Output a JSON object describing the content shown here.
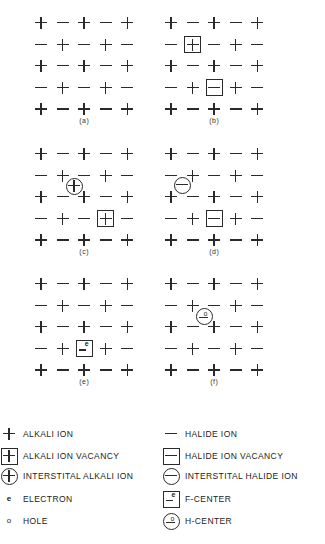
{
  "figure": {
    "panels": [
      {
        "id": "a",
        "label": "(a)",
        "origin": [
          41,
          23
        ],
        "defects": []
      },
      {
        "id": "b",
        "label": "(b)",
        "origin": [
          171,
          23
        ],
        "defects": [
          {
            "type": "alkali-ion-vacancy",
            "row": 1,
            "col": 1
          },
          {
            "type": "halide-ion-vacancy",
            "row": 3,
            "col": 2
          }
        ]
      },
      {
        "id": "c",
        "label": "(c)",
        "origin": [
          41,
          154
        ],
        "defects": [
          {
            "type": "interstitial-alkali-ion",
            "x": 74,
            "y": 186
          },
          {
            "type": "alkali-ion-vacancy",
            "row": 3,
            "col": 3
          }
        ]
      },
      {
        "id": "d",
        "label": "(d)",
        "origin": [
          171,
          154
        ],
        "defects": [
          {
            "type": "interstitial-halide-ion",
            "x": 182,
            "y": 185
          },
          {
            "type": "halide-ion-vacancy",
            "row": 3,
            "col": 2
          }
        ]
      },
      {
        "id": "e",
        "label": "(e)",
        "origin": [
          41,
          284
        ],
        "defects": [
          {
            "type": "f-center",
            "row": 3,
            "col": 2
          }
        ]
      },
      {
        "id": "f",
        "label": "(f)",
        "origin": [
          171,
          284
        ],
        "defects": [
          {
            "type": "h-center",
            "x": 204,
            "y": 316
          }
        ]
      }
    ],
    "lattice": {
      "rows": 5,
      "cols": 5,
      "spacing": 21.6,
      "pattern_row_even": [
        "+",
        "-",
        "+",
        "-",
        "+"
      ],
      "pattern_row_odd": [
        "-",
        "+",
        "-",
        "+",
        "-"
      ]
    }
  },
  "legend": {
    "left": [
      {
        "icon": "alkali-ion",
        "label": "ALKALI ION"
      },
      {
        "icon": "alkali-ion-vacancy",
        "label": "ALKALI ION VACANCY"
      },
      {
        "icon": "interstitial-alkali-ion",
        "label": "INTERSTITAL ALKALI ION"
      },
      {
        "icon": "electron",
        "symbol": "e",
        "label": "ELECTRON"
      },
      {
        "icon": "hole",
        "symbol": "o",
        "label": "HOLE"
      }
    ],
    "right": [
      {
        "icon": "halide-ion",
        "label": "HALIDE ION"
      },
      {
        "icon": "halide-ion-vacancy",
        "label": "HALIDE ION VACANCY"
      },
      {
        "icon": "interstitial-halide-ion",
        "label": "INTERSTITAL HALIDE ION"
      },
      {
        "icon": "f-center",
        "symbol": "e",
        "label": "F-CENTER"
      },
      {
        "icon": "h-center",
        "symbol": "o",
        "label": "H-CENTER"
      }
    ]
  }
}
